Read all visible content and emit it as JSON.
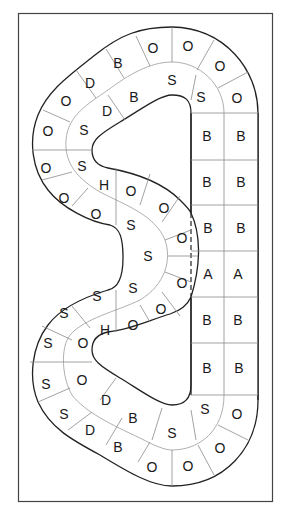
{
  "diagram": {
    "colors": {
      "outline": "#222222",
      "cell_lines": "#8a8a8a",
      "frame": "#444444",
      "background": "#ffffff"
    },
    "letters": [
      {
        "t": "O",
        "x": 153,
        "y": 48
      },
      {
        "t": "O",
        "x": 188,
        "y": 46
      },
      {
        "t": "O",
        "x": 220,
        "y": 66
      },
      {
        "t": "O",
        "x": 237,
        "y": 98
      },
      {
        "t": "B",
        "x": 118,
        "y": 63
      },
      {
        "t": "D",
        "x": 90,
        "y": 83
      },
      {
        "t": "O",
        "x": 66,
        "y": 101
      },
      {
        "t": "S",
        "x": 172,
        "y": 80
      },
      {
        "t": "S",
        "x": 201,
        "y": 97
      },
      {
        "t": "B",
        "x": 134,
        "y": 97
      },
      {
        "t": "D",
        "x": 107,
        "y": 111
      },
      {
        "t": "O",
        "x": 48,
        "y": 131
      },
      {
        "t": "S",
        "x": 84,
        "y": 130
      },
      {
        "t": "O",
        "x": 46,
        "y": 168
      },
      {
        "t": "S",
        "x": 82,
        "y": 166
      },
      {
        "t": "H",
        "x": 104,
        "y": 185
      },
      {
        "t": "O",
        "x": 131,
        "y": 191
      },
      {
        "t": "O",
        "x": 64,
        "y": 198
      },
      {
        "t": "O",
        "x": 96,
        "y": 214
      },
      {
        "t": "O",
        "x": 164,
        "y": 208
      },
      {
        "t": "S",
        "x": 131,
        "y": 225
      },
      {
        "t": "O",
        "x": 182,
        "y": 238
      },
      {
        "t": "S",
        "x": 148,
        "y": 256
      },
      {
        "t": "O",
        "x": 182,
        "y": 283
      },
      {
        "t": "S",
        "x": 133,
        "y": 288
      },
      {
        "t": "S",
        "x": 97,
        "y": 296
      },
      {
        "t": "S",
        "x": 64,
        "y": 313
      },
      {
        "t": "H",
        "x": 105,
        "y": 330
      },
      {
        "t": "O",
        "x": 133,
        "y": 325
      },
      {
        "t": "O",
        "x": 161,
        "y": 309
      },
      {
        "t": "S",
        "x": 48,
        "y": 343
      },
      {
        "t": "O",
        "x": 83,
        "y": 343
      },
      {
        "t": "S",
        "x": 46,
        "y": 384
      },
      {
        "t": "O",
        "x": 82,
        "y": 380
      },
      {
        "t": "S",
        "x": 64,
        "y": 414
      },
      {
        "t": "D",
        "x": 106,
        "y": 400
      },
      {
        "t": "D",
        "x": 90,
        "y": 430
      },
      {
        "t": "B",
        "x": 133,
        "y": 418
      },
      {
        "t": "B",
        "x": 118,
        "y": 447
      },
      {
        "t": "S",
        "x": 172,
        "y": 433
      },
      {
        "t": "S",
        "x": 205,
        "y": 409
      },
      {
        "t": "O",
        "x": 237,
        "y": 414
      },
      {
        "t": "O",
        "x": 220,
        "y": 448
      },
      {
        "t": "O",
        "x": 152,
        "y": 467
      },
      {
        "t": "O",
        "x": 188,
        "y": 466
      }
    ],
    "grid": {
      "rows": [
        [
          "B",
          "B"
        ],
        [
          "B",
          "B"
        ],
        [
          "B",
          "B"
        ],
        [
          "A",
          "A"
        ],
        [
          "B",
          "B"
        ],
        [
          "B",
          "B"
        ]
      ]
    }
  }
}
